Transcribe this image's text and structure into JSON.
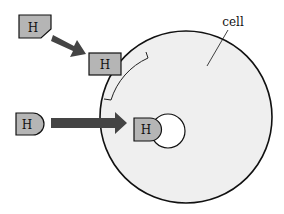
{
  "diagram": {
    "cell_label": "cell",
    "hormone_label": "H",
    "colors": {
      "cell_fill": "#efefef",
      "hormone_fill": "#b5b5b5",
      "arrow": "#444444",
      "outline": "#111111"
    },
    "elements": [
      {
        "id": "hormone-peptide-outside",
        "label": "H"
      },
      {
        "id": "hormone-peptide-at-receptor",
        "label": "H"
      },
      {
        "id": "hormone-steroid-outside",
        "label": "H"
      },
      {
        "id": "hormone-steroid-inside",
        "label": "H"
      }
    ]
  }
}
